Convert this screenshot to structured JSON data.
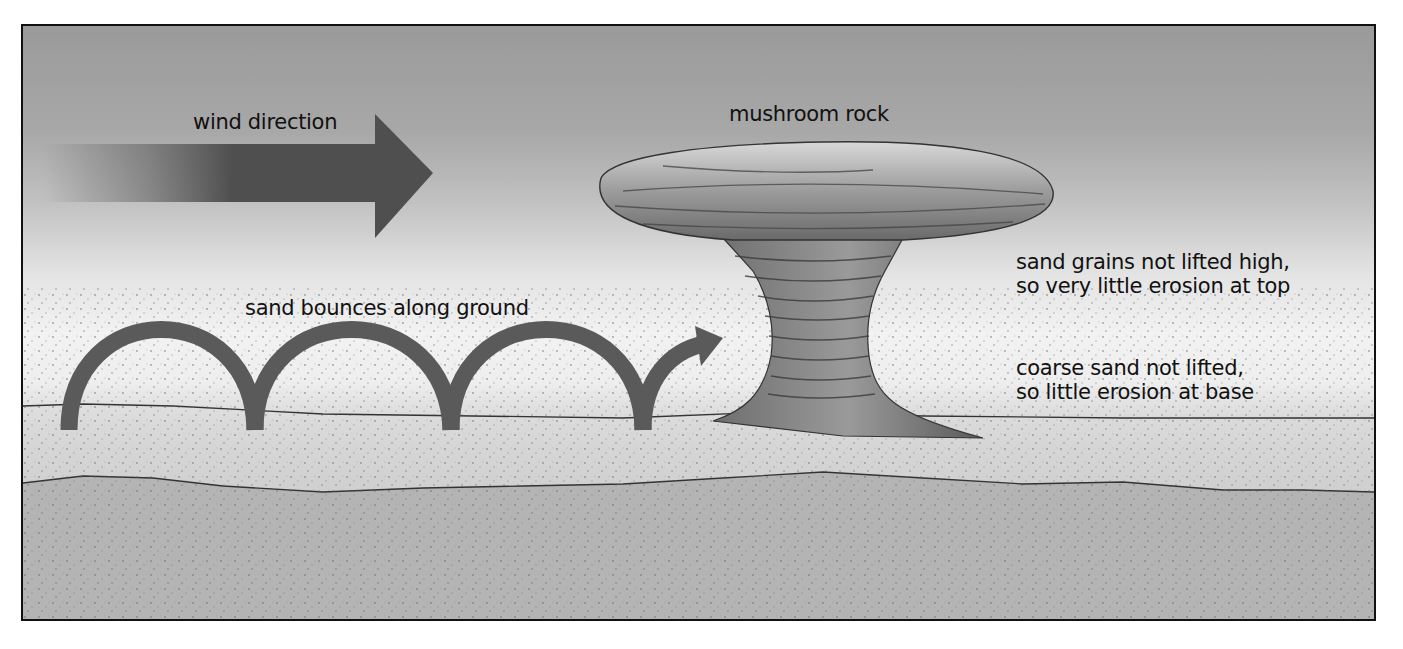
{
  "diagram": {
    "labels": {
      "wind_direction": "wind direction",
      "mushroom_rock": "mushroom rock",
      "sand_bounces": "sand bounces along ground",
      "top_note_line1": "sand grains not lifted high,",
      "top_note_line2": "so very little erosion at top",
      "base_note_line1": "coarse sand not lifted,",
      "base_note_line2": "so little erosion at base"
    },
    "elements": {
      "wind_arrow": {
        "direction": "right",
        "color": "#555555"
      },
      "bounce_arrow": {
        "bounces": 4,
        "color": "#5a5a5a"
      },
      "rock": {
        "color": "#8a8a8a"
      },
      "ground_layers": [
        "surface sand layer",
        "bedrock layer"
      ]
    },
    "colors": {
      "sky_top": "#9a9a9a",
      "sky_bottom": "#f2f2f2",
      "ground": "#b8b8b8",
      "border": "#111111",
      "arrow": "#555555"
    }
  }
}
